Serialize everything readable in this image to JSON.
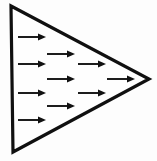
{
  "figure": {
    "type": "vector-field-diagram",
    "title": "",
    "caption": "",
    "background_color": "#fdfdfd",
    "stroke_color": "#101010",
    "arrow_color": "#111111",
    "canvas": {
      "width": 157,
      "height": 161
    },
    "shape": {
      "name": "triangle",
      "orientation": "pointing-right",
      "vertices": [
        {
          "x": 11,
          "y": 6
        },
        {
          "x": 149,
          "y": 79
        },
        {
          "x": 13,
          "y": 152
        }
      ],
      "stroke_width": 3.2
    },
    "arrows": {
      "direction": "right",
      "count": 11,
      "shaft_length": 28,
      "head_length": 8,
      "head_width": 7,
      "items": [
        {
          "row": 1,
          "x1": 18,
          "y": 37,
          "x2": 46
        },
        {
          "row": 2,
          "x1": 47,
          "y": 54,
          "x2": 75
        },
        {
          "row": 3,
          "x1": 18,
          "y": 64,
          "x2": 46
        },
        {
          "row": 3,
          "x1": 78,
          "y": 64,
          "x2": 106
        },
        {
          "row": 4,
          "x1": 47,
          "y": 79,
          "x2": 75
        },
        {
          "row": 4,
          "x1": 107,
          "y": 79,
          "x2": 135
        },
        {
          "row": 5,
          "x1": 18,
          "y": 93,
          "x2": 46
        },
        {
          "row": 5,
          "x1": 78,
          "y": 93,
          "x2": 106
        },
        {
          "row": 6,
          "x1": 47,
          "y": 106,
          "x2": 75
        },
        {
          "row": 7,
          "x1": 18,
          "y": 120,
          "x2": 46
        },
        {
          "row": 0,
          "x1": 47,
          "y": 0,
          "x2": 47
        }
      ]
    }
  }
}
